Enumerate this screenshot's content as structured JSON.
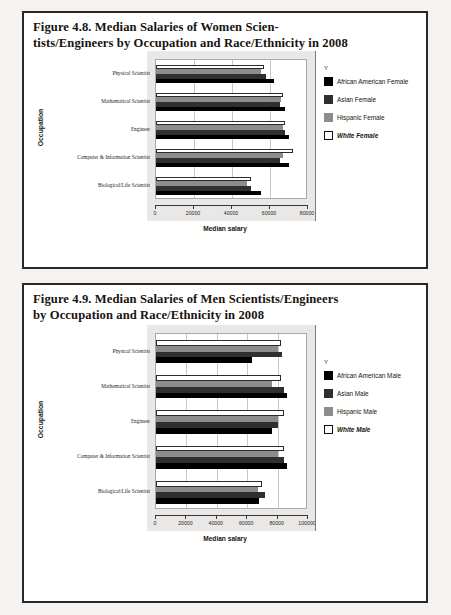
{
  "page": {
    "background_color": "#f4f3f1",
    "border_color": "#2a2724"
  },
  "figures": [
    {
      "id": "figure-4-8",
      "title_line1": "Figure 4.8. Median Salaries of Women Scien-",
      "title_line2": "tists/Engineers by Occupation and Race/Ethnicity in 2008",
      "chart_name": "women-scientists-salary-chart"
    },
    {
      "id": "figure-4-9",
      "title_line1": "Figure 4.9. Median Salaries of Men Scientists/Engineers",
      "title_line2": "by Occupation and Race/Ethnicity in 2008",
      "chart_name": "men-scientists-salary-chart"
    }
  ],
  "chart_data": [
    {
      "type": "bar",
      "orientation": "horizontal",
      "title": "Figure 4.8. Median Salaries of Women Scientists/Engineers by Occupation and Race/Ethnicity in 2008",
      "xlabel": "Median salary",
      "ylabel": "Occupation",
      "xlim": [
        0,
        80000
      ],
      "xticks": [
        0,
        20000,
        40000,
        60000,
        80000
      ],
      "xtick_labels": [
        "0",
        "20000",
        "40000",
        "60000",
        "80000"
      ],
      "grid": true,
      "legend_title": "Y",
      "legend_position": "right",
      "categories": [
        "Physical Scientist",
        "Mathematical Scientist",
        "Engineer",
        "Computer & Information Scientist",
        "Biological/Life Scientist"
      ],
      "series": [
        {
          "name": "African American Female",
          "color": "#000000",
          "values": [
            62000,
            68000,
            70000,
            70000,
            55000
          ]
        },
        {
          "name": "Asian Female",
          "color": "#2f2f2f",
          "values": [
            58000,
            65000,
            68000,
            65000,
            50000
          ]
        },
        {
          "name": "Hispanic Female",
          "color": "#8c8c8c",
          "values": [
            55000,
            66000,
            67000,
            67000,
            48000
          ]
        },
        {
          "name": "White Female",
          "color": "#ffffff",
          "values": [
            57000,
            67000,
            68000,
            72000,
            50000
          ]
        }
      ]
    },
    {
      "type": "bar",
      "orientation": "horizontal",
      "title": "Figure 4.9. Median Salaries of Men Scientists/Engineers by Occupation and Race/Ethnicity in 2008",
      "xlabel": "Median salary",
      "ylabel": "Occupation",
      "xlim": [
        0,
        100000
      ],
      "xticks": [
        0,
        20000,
        40000,
        60000,
        80000,
        100000
      ],
      "xtick_labels": [
        "0",
        "20000",
        "40000",
        "60000",
        "80000",
        "100000"
      ],
      "grid": true,
      "legend_title": "Y",
      "legend_position": "right",
      "categories": [
        "Physical Scientist",
        "Mathematical Scientist",
        "Engineer",
        "Computer & Information Scientist",
        "Biological/Life Scientist"
      ],
      "series": [
        {
          "name": "African American Male",
          "color": "#000000",
          "values": [
            63000,
            86000,
            76000,
            86000,
            68000
          ]
        },
        {
          "name": "Asian Male",
          "color": "#2f2f2f",
          "values": [
            83000,
            84000,
            80000,
            84000,
            72000
          ]
        },
        {
          "name": "Hispanic Male",
          "color": "#8c8c8c",
          "values": [
            80000,
            76000,
            80000,
            80000,
            67000
          ]
        },
        {
          "name": "White Male",
          "color": "#ffffff",
          "values": [
            82000,
            82000,
            84000,
            84000,
            70000
          ]
        }
      ]
    }
  ]
}
